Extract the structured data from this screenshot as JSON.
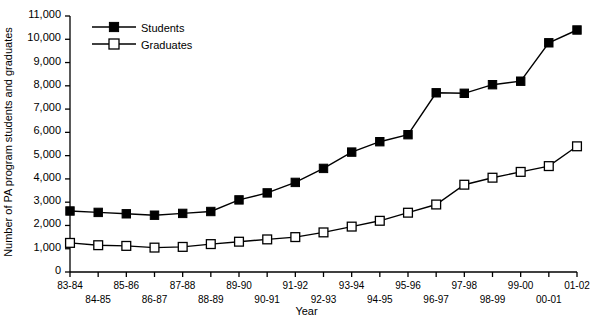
{
  "chart_data": {
    "type": "line",
    "title": "",
    "xlabel": "Year",
    "ylabel": "Number of PA program students and graduates",
    "categories": [
      "83-84",
      "84-85",
      "85-86",
      "86-87",
      "87-88",
      "88-89",
      "89-90",
      "90-91",
      "91-92",
      "92-93",
      "93-94",
      "94-95",
      "95-96",
      "96-97",
      "97-98",
      "98-99",
      "99-00",
      "00-01",
      "01-02"
    ],
    "series": [
      {
        "name": "Students",
        "marker": "filled-square",
        "values": [
          2620,
          2560,
          2500,
          2440,
          2520,
          2600,
          3100,
          3400,
          3850,
          4450,
          5150,
          5600,
          5900,
          7700,
          7680,
          8050,
          8200,
          9850,
          10400
        ]
      },
      {
        "name": "Graduates",
        "marker": "open-square",
        "values": [
          1250,
          1150,
          1120,
          1050,
          1080,
          1200,
          1300,
          1400,
          1500,
          1700,
          1950,
          2200,
          2550,
          2900,
          3750,
          4050,
          4300,
          4550,
          5400
        ]
      }
    ],
    "ylim": [
      0,
      11000
    ],
    "ytick_labels": [
      "0",
      "1,000",
      "2,000",
      "3,000",
      "4,000",
      "5,000",
      "6,000",
      "7,000",
      "8,000",
      "9,000",
      "10,000",
      "11,000"
    ],
    "ytick_values": [
      0,
      1000,
      2000,
      3000,
      4000,
      5000,
      6000,
      7000,
      8000,
      9000,
      10000,
      11000
    ],
    "grid": false,
    "legend_position": "top-left-inside",
    "colors": {
      "axis": "#000000",
      "students": "#000000",
      "graduates": "#000000",
      "marker_fill_open": "#ffffff"
    }
  },
  "legend": {
    "items": [
      {
        "label": "Students"
      },
      {
        "label": "Graduates"
      }
    ]
  }
}
